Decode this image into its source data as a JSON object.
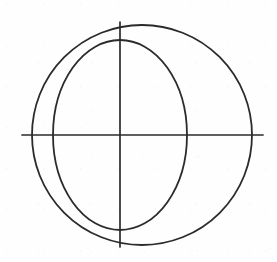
{
  "figure": {
    "title": "Circle and ellipse intersecting on a pair of axes",
    "type": "line-drawing",
    "background_color": "#fefefe",
    "stroke_color": "#2b2b2b",
    "canvas": {
      "width": 277,
      "height": 262
    },
    "shapes": [
      {
        "name": "large-circle",
        "kind": "circle",
        "cx": 142,
        "cy": 135,
        "r": 110,
        "stroke_width": 1.8,
        "extent": {
          "left": 32,
          "right": 252,
          "top": 25,
          "bottom": 245
        }
      },
      {
        "name": "ellipse",
        "kind": "ellipse",
        "cx": 120,
        "cy": 135,
        "rx": 67,
        "ry": 95,
        "stroke_width": 1.8,
        "extent": {
          "left": 53,
          "right": 187,
          "top": 40,
          "bottom": 230
        }
      },
      {
        "name": "vertical-axis",
        "kind": "line",
        "x1": 120,
        "y1": 22,
        "x2": 120,
        "y2": 247,
        "stroke_width": 1.7
      },
      {
        "name": "horizontal-axis",
        "kind": "line",
        "x1": 22,
        "y1": 135,
        "x2": 263,
        "y2": 135,
        "stroke_width": 1.7
      }
    ],
    "intersection_points": [
      {
        "name": "top-vertex",
        "x": 120,
        "y": 40
      },
      {
        "name": "bottom-vertex",
        "x": 120,
        "y": 230
      },
      {
        "name": "center",
        "x": 120,
        "y": 135
      }
    ]
  }
}
